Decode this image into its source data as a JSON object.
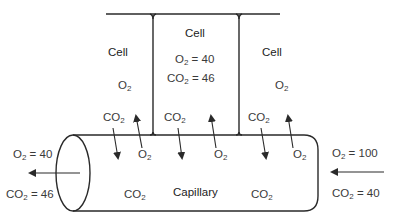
{
  "diagram": {
    "cells": [
      {
        "label": "Cell",
        "gas_labels": [
          "O2",
          "CO2"
        ]
      },
      {
        "label": "Cell",
        "o2": "O2 = 40",
        "co2": "CO2 = 46"
      },
      {
        "label": "Cell",
        "gas_labels": [
          "O2",
          "CO2"
        ]
      }
    ],
    "capillary": {
      "label": "Capillary",
      "inside_labels": [
        "CO2",
        "CO2"
      ]
    },
    "exchange_labels": {
      "cell1_co2": "CO2",
      "cell1_o2_top": "O2",
      "cell1_co2_down": "CO2",
      "cap_o2_1": "O2",
      "cell2_co2": "CO2",
      "cap_o2_2": "O2",
      "cell3_co2": "CO2",
      "cap_o2_3": "O2"
    },
    "outflow": {
      "o2": "O2 = 40",
      "co2": "CO2 = 46",
      "direction": "left"
    },
    "inflow": {
      "o2": "O2 = 100",
      "co2": "CO2 = 40",
      "direction": "left"
    },
    "colors": {
      "line": "#2a2a2a",
      "text": "#3a3a3a",
      "background": "#ffffff"
    }
  }
}
